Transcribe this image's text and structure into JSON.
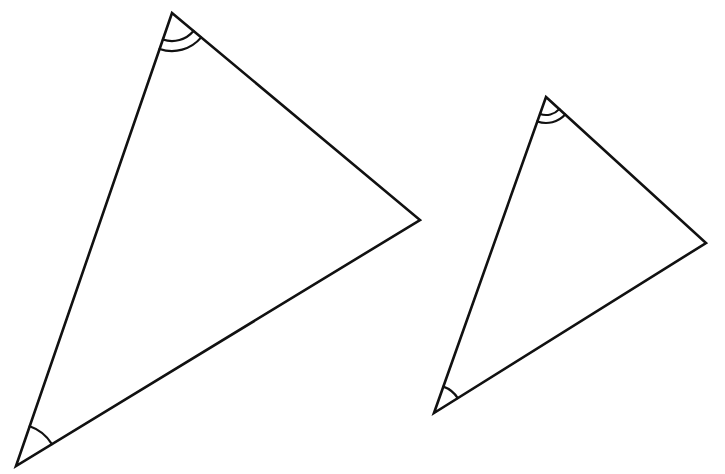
{
  "diagram": {
    "stroke_color": "#111111",
    "background": "#ffffff",
    "triangles": [
      {
        "name": "large-triangle",
        "vertices": {
          "top": [
            172,
            13
          ],
          "right": [
            420,
            220
          ],
          "bottom_left": [
            16,
            466
          ]
        },
        "angle_marks": [
          {
            "vertex": "top",
            "arcs": 2,
            "radii": [
              28,
              38
            ]
          },
          {
            "vertex": "bottom_left",
            "arcs": 1,
            "radii": [
              42
            ]
          }
        ]
      },
      {
        "name": "small-triangle",
        "vertices": {
          "top": [
            546,
            97
          ],
          "right": [
            706,
            243
          ],
          "bottom_left": [
            434,
            413
          ]
        },
        "angle_marks": [
          {
            "vertex": "top",
            "arcs": 2,
            "radii": [
              18,
              26
            ]
          },
          {
            "vertex": "bottom_left",
            "arcs": 1,
            "radii": [
              28
            ]
          }
        ]
      }
    ]
  }
}
